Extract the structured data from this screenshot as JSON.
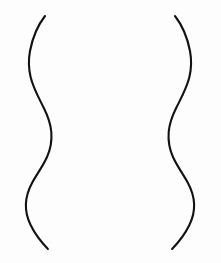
{
  "document": {
    "title": "Hourglass Contour Line Drawing",
    "width": 221,
    "height": 263,
    "background_color": "#fdfdfd",
    "description": "Two mirrored freehand S-curves forming an open hourglass / torso silhouette outline"
  },
  "drawing": {
    "stroke_color": "#121212",
    "stroke_width": 2.1,
    "stroke_linecap": "round",
    "fill": "none",
    "shape_name": "hourglass-contour",
    "symmetry": "bilateral-vertical",
    "axis_of_symmetry_x": 110,
    "paths": [
      {
        "name": "left-contour-curve",
        "role": "left silhouette edge",
        "top_point": [
          45,
          16
        ],
        "bottom_point": [
          48,
          249
        ],
        "extremes": {
          "upper_bulge_leftmost": [
            29,
            61
          ],
          "waist_rightmost": [
            51,
            145
          ],
          "lower_bulge_leftmost": [
            26,
            209
          ]
        },
        "d": "M 45.0 16.0 C 38.0 25.0 32.5 38.0 30.0 51.0 C 28.4 59.5 28.6 68.5 30.6 77.0 C 33.2 88.0 38.6 97.5 43.6 107.5 C 47.6 115.5 50.6 123.5 51.3 132.0 C 52.0 140.5 50.6 149.0 47.0 157.0 C 43.0 166.0 37.0 174.0 32.3 182.5 C 28.6 189.3 26.2 196.5 25.9 204.0 C 25.6 211.5 27.4 218.5 30.6 225.0 C 34.6 233.2 40.4 241.2 47.9 249.0"
      },
      {
        "name": "right-contour-curve",
        "role": "right silhouette edge",
        "top_point": [
          175,
          16
        ],
        "bottom_point": [
          172,
          249
        ],
        "extremes": {
          "upper_bulge_rightmost": [
            191,
            61
          ],
          "waist_leftmost": [
            169,
            145
          ],
          "lower_bulge_rightmost": [
            195,
            209
          ]
        },
        "d": "M 175.0 16.0 C 182.0 25.0 187.5 38.0 190.0 51.0 C 191.6 59.5 191.4 68.5 189.4 77.0 C 186.8 88.0 181.4 97.5 176.4 107.5 C 172.4 115.5 169.4 123.5 168.7 132.0 C 168.0 140.5 169.4 149.0 173.0 157.0 C 177.0 166.0 183.0 174.0 187.7 182.5 C 191.4 189.3 193.8 196.5 194.1 204.0 C 194.4 211.5 192.6 218.5 189.4 225.0 C 185.4 233.2 179.6 241.2 172.1 249.0"
      }
    ]
  }
}
